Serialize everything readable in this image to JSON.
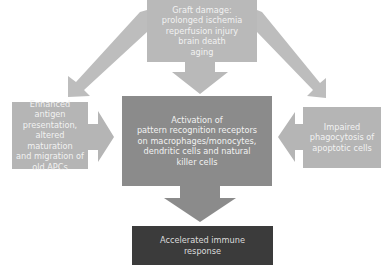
{
  "diagram": {
    "top_box": {
      "lines": [
        "Graft damage:",
        "prolonged ischemia",
        "reperfusion injury",
        "brain death",
        "aging"
      ]
    },
    "left_box": {
      "lines": [
        "Enhanced antigen",
        "presentation,",
        "altered maturation",
        "and migration of",
        "old APCs"
      ]
    },
    "center_box": {
      "lines": [
        "Activation of",
        "pattern recognition receptors",
        "on macrophages/monocytes,",
        "dendritic cells and natural",
        "killer cells"
      ]
    },
    "right_box": {
      "lines": [
        "Impaired",
        "phagocytosis of",
        "apoptotic cells"
      ]
    },
    "bottom_box": {
      "lines": [
        "Accelerated immune",
        "response"
      ]
    },
    "colors": {
      "light_box": "#b9b9b9",
      "center_box": "#8b8b8b",
      "bottom_box": "#3b3b3b",
      "arrow": "#bdbdbd",
      "center_arrow": "#8b8b8b"
    }
  }
}
